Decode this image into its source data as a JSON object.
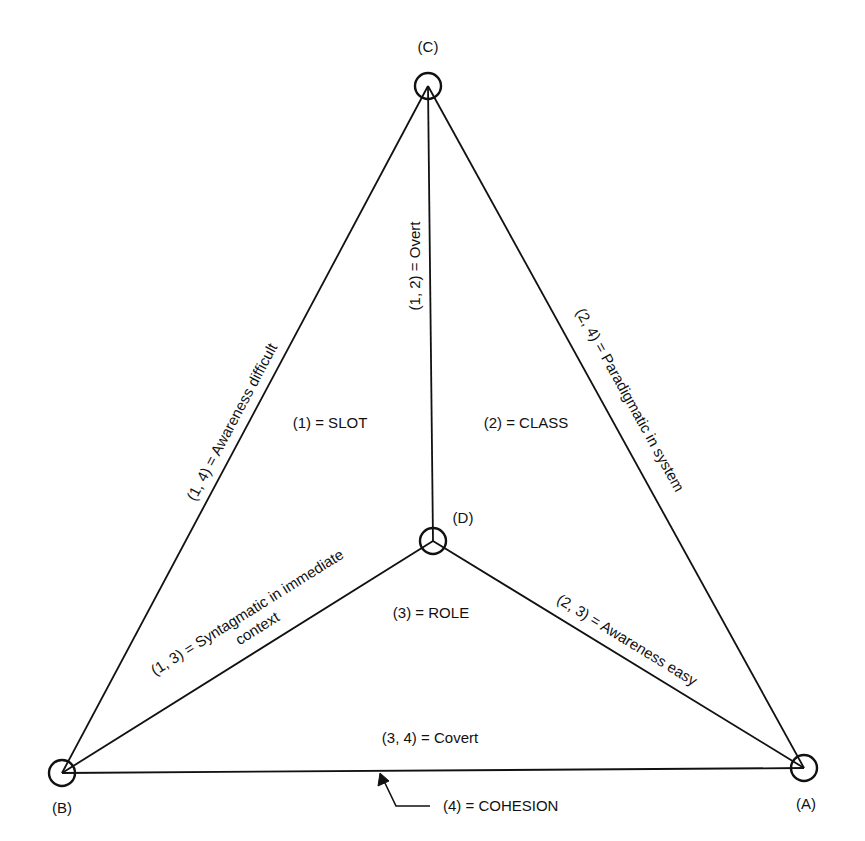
{
  "diagram": {
    "type": "tetrahedral concept diagram",
    "stroke_color": "#111111",
    "background_color": "#ffffff",
    "nodes": [
      {
        "id": "C",
        "label": "(C)",
        "x": 428,
        "y": 86
      },
      {
        "id": "D",
        "label": "(D)",
        "x": 433,
        "y": 541
      },
      {
        "id": "B",
        "label": "(B)",
        "x": 62,
        "y": 773
      },
      {
        "id": "A",
        "label": "(A)",
        "x": 804,
        "y": 768
      }
    ],
    "edges": [
      {
        "from": "C",
        "to": "B",
        "label": "(1, 4) = Awareness difficult"
      },
      {
        "from": "C",
        "to": "A",
        "label": "(2, 4) = Paradigmatic in system"
      },
      {
        "from": "C",
        "to": "D",
        "label": "(1, 2) = Overt"
      },
      {
        "from": "D",
        "to": "B",
        "label_line1": "(1, 3) = Syntagmatic in immediate",
        "label_line2": "context"
      },
      {
        "from": "D",
        "to": "A",
        "label": "(2, 3) = Awareness easy"
      },
      {
        "from": "B",
        "to": "A",
        "label": "(3, 4) = Covert"
      }
    ],
    "regions": {
      "slot": "(1) = SLOT",
      "class": "(2) = CLASS",
      "role": "(3) = ROLE",
      "cohesion": "(4) = COHESION"
    }
  }
}
